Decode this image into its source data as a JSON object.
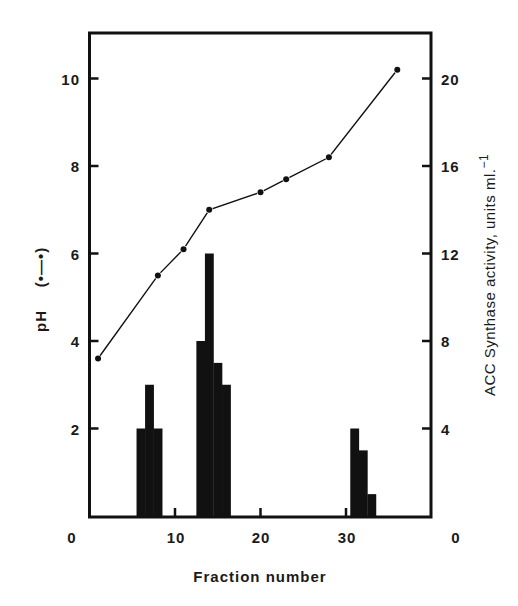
{
  "chart_data": {
    "type": "bar+line",
    "title": "",
    "xlabel": "Fraction number",
    "ylabel_left": "pH",
    "ylabel_left_legend": "(•—•)",
    "ylabel_right": "ACC Synthase activity, units ml.",
    "ylabel_right_superscript": "−1",
    "xlim": [
      0,
      40
    ],
    "ylim_left": [
      0,
      11
    ],
    "ylim_right": [
      0,
      22
    ],
    "x_ticks": [
      10,
      20,
      30
    ],
    "x_tick_labels": [
      "0",
      "10",
      "20",
      "30",
      "0"
    ],
    "y_left_ticks": [
      2,
      4,
      6,
      8,
      10
    ],
    "y_left_tick_labels": [
      "2",
      "4",
      "6",
      "8",
      "10"
    ],
    "y_right_ticks": [
      4,
      8,
      12,
      16,
      20
    ],
    "y_right_tick_labels": [
      "4",
      "8",
      "12",
      "16",
      "20"
    ],
    "grid": false,
    "series": [
      {
        "name": "pH",
        "type": "line",
        "axis": "left",
        "marker": "dot",
        "x": [
          1,
          8,
          11,
          14,
          20,
          23,
          28,
          36
        ],
        "values": [
          3.6,
          5.5,
          6.1,
          7.0,
          7.4,
          7.7,
          8.2,
          10.2
        ]
      },
      {
        "name": "ACC Synthase activity",
        "type": "bar",
        "axis": "right",
        "x": [
          6,
          7,
          8,
          13,
          14,
          15,
          16,
          31,
          32,
          33
        ],
        "values": [
          4,
          6,
          4,
          8,
          12,
          7,
          6,
          4,
          3,
          1
        ]
      }
    ]
  },
  "colors": {
    "ink": "#111111",
    "background": "#ffffff"
  }
}
